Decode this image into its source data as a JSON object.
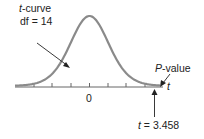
{
  "diagram": {
    "curve_label_var": "t",
    "curve_label_rest": "-curve",
    "df_label": "df = 14",
    "pvalue_var": "P",
    "pvalue_rest": "-value",
    "axis_var": "t",
    "zero_tick": "0",
    "tstat_var": "t",
    "tstat_rest": " = 3.458",
    "df": 14,
    "t_statistic": 3.458,
    "curve_color": "#8a8a8a",
    "axis_color": "#555555"
  }
}
